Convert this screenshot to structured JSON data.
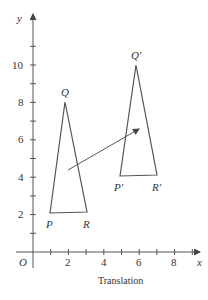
{
  "figure": {
    "caption": "Translation",
    "axes": {
      "x_label": "x",
      "y_label": "y",
      "origin_label": "O",
      "x_ticks": [
        "2",
        "4",
        "6",
        "8"
      ],
      "y_ticks": [
        "2",
        "4",
        "6",
        "8",
        "10"
      ]
    },
    "original_triangle": {
      "vertices": [
        {
          "label": "P",
          "x": 1,
          "y": 2
        },
        {
          "label": "Q",
          "x": 1.8,
          "y": 8
        },
        {
          "label": "R",
          "x": 3,
          "y": 2
        }
      ]
    },
    "image_triangle": {
      "vertices": [
        {
          "label": "P'",
          "x": 4.8,
          "y": 4
        },
        {
          "label": "Q'",
          "x": 5.8,
          "y": 10
        },
        {
          "label": "R'",
          "x": 6.8,
          "y": 4
        }
      ]
    },
    "translation_vector": {
      "from": [
        2,
        4.5
      ],
      "to": [
        6,
        6.8
      ]
    },
    "colors": {
      "stroke": "#555555",
      "text": "#333333"
    }
  }
}
